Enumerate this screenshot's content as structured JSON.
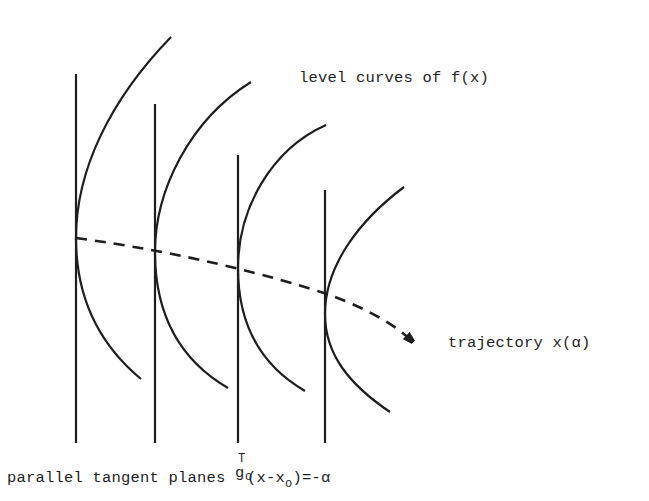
{
  "diagram": {
    "labels": {
      "level_curves": "level curves of f(x)",
      "trajectory": "trajectory x(α)",
      "planes_prefix": "parallel tangent planes ",
      "planes_g": "g",
      "planes_sup": "T",
      "planes_sub": "o",
      "planes_mid": "(x-x",
      "planes_sub2": "o",
      "planes_suffix": ")=-α"
    },
    "elements": {
      "tangent_planes_count": 4,
      "level_curves_count": 4,
      "trajectory_style": "dashed-with-arrow"
    },
    "colors": {
      "ink": "#1e1e1e",
      "background": "#ffffff"
    }
  }
}
